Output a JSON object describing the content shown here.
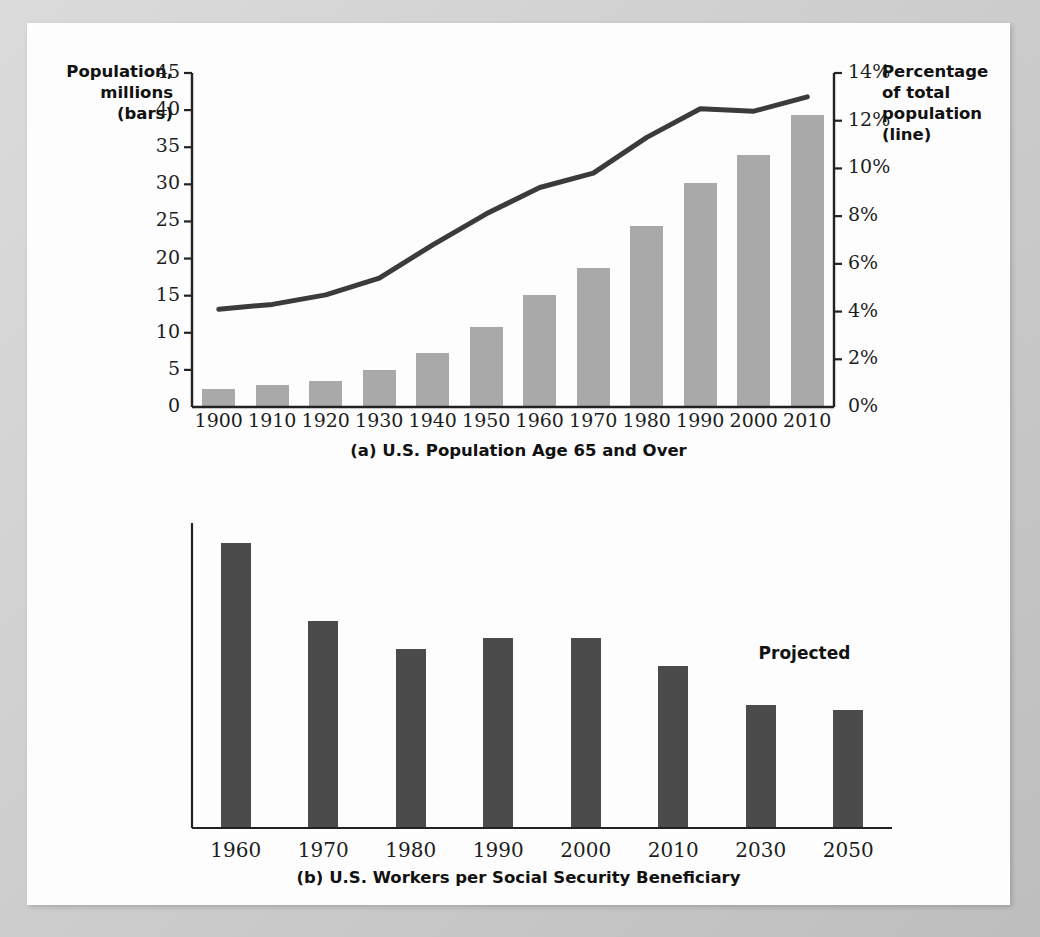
{
  "chart_data": [
    {
      "type": "bar",
      "id": "panel-a",
      "title": "(a) U.S. Population Age 65 and Over",
      "xlabel": "",
      "ylabel": "Population, millions (bars)",
      "y2label": "Percentage of total population (line)",
      "categories": [
        "1900",
        "1910",
        "1920",
        "1930",
        "1940",
        "1950",
        "1960",
        "1970",
        "1980",
        "1990",
        "2000",
        "2010"
      ],
      "ylim": [
        0,
        45
      ],
      "yticks": [
        "0",
        "5",
        "10",
        "15",
        "20",
        "25",
        "30",
        "35",
        "40",
        "45"
      ],
      "y2lim": [
        0,
        14
      ],
      "y2ticks": [
        "0%",
        "2%",
        "4%",
        "6%",
        "8%",
        "10%",
        "12%",
        "14%"
      ],
      "grid": false,
      "legend": "none",
      "series": [
        {
          "name": "Population, millions (bars)",
          "type": "bar",
          "axis": "left",
          "color": "#a9a9a9",
          "values": [
            2.4,
            2.9,
            3.5,
            5.0,
            7.3,
            10.8,
            15.1,
            18.7,
            24.4,
            30.2,
            33.9,
            39.4
          ]
        },
        {
          "name": "Percentage of total population (line)",
          "type": "line",
          "axis": "right",
          "color": "#3b3b3b",
          "values": [
            4.1,
            4.3,
            4.7,
            5.4,
            6.8,
            8.1,
            9.2,
            9.8,
            11.3,
            12.5,
            12.4,
            13.0
          ]
        }
      ]
    },
    {
      "type": "bar",
      "id": "panel-b",
      "title": "(b) U.S. Workers per Social Security Beneficiary",
      "xlabel": "",
      "ylabel": "",
      "categories": [
        "1960",
        "1970",
        "1980",
        "1990",
        "2000",
        "2010",
        "2030",
        "2050"
      ],
      "values": [
        5.1,
        3.7,
        3.2,
        3.4,
        3.4,
        2.9,
        2.2,
        2.1
      ],
      "value_labels": [
        "5.1",
        "3.7",
        "3.2",
        "3.4",
        "3.4",
        "2.9",
        "2.2",
        "2.1"
      ],
      "ylim": [
        0,
        5.45
      ],
      "grid": false,
      "legend": "none",
      "bar_color": "#4b4b4b",
      "annotations": [
        {
          "text": "Projected",
          "covers": [
            "2030",
            "2050"
          ]
        }
      ]
    }
  ],
  "panel_a": {
    "left_axis_title": "Population,\nmillions\n(bars)",
    "left_axis_title_lines": [
      "Population,",
      "millions",
      "(bars)"
    ],
    "right_axis_title_lines": [
      "Percentage",
      "of total",
      "population",
      "(line)"
    ],
    "caption": "(a) U.S. Population Age 65 and Over"
  },
  "panel_b": {
    "caption": "(b) U.S. Workers per Social Security Beneficiary",
    "projected_label": "Projected"
  },
  "colors": {
    "panel_a_bar": "#a9a9a9",
    "panel_a_line": "#3b3b3b",
    "panel_b_bar": "#4b4b4b",
    "page_background": "#fdfdfd",
    "backdrop": "#c8c8c8",
    "text": "#1a1a1a"
  }
}
